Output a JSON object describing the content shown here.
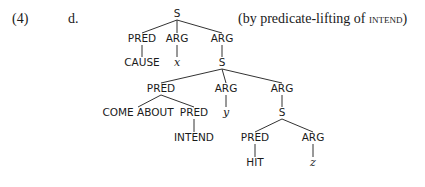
{
  "example_number": "(4)",
  "sub_label": "d.",
  "caption": {
    "prefix": "(by predicate-lifting of ",
    "smallcaps": "intend",
    "suffix": ")"
  },
  "tree": {
    "nodes": [
      {
        "id": "n0",
        "label": "S",
        "x": 177,
        "y": 17,
        "style": "label"
      },
      {
        "id": "n1",
        "label": "PRED",
        "x": 142,
        "y": 42,
        "style": "label"
      },
      {
        "id": "n2",
        "label": "ARG",
        "x": 177,
        "y": 42,
        "style": "label"
      },
      {
        "id": "n3",
        "label": "ARG",
        "x": 222,
        "y": 42,
        "style": "label"
      },
      {
        "id": "n4",
        "label": "CAUSE",
        "x": 142,
        "y": 66,
        "style": "label"
      },
      {
        "id": "n5",
        "label": "x",
        "x": 177,
        "y": 66,
        "style": "var"
      },
      {
        "id": "n6",
        "label": "S",
        "x": 222,
        "y": 66,
        "style": "label"
      },
      {
        "id": "n7",
        "label": "PRED",
        "x": 161,
        "y": 92,
        "style": "label"
      },
      {
        "id": "n8",
        "label": "ARG",
        "x": 226,
        "y": 92,
        "style": "label"
      },
      {
        "id": "n9",
        "label": "ARG",
        "x": 282,
        "y": 92,
        "style": "label"
      },
      {
        "id": "n10",
        "label": "COME ABOUT",
        "x": 138,
        "y": 116,
        "style": "label"
      },
      {
        "id": "n11",
        "label": "PRED",
        "x": 194,
        "y": 116,
        "style": "label"
      },
      {
        "id": "n12",
        "label": "y",
        "x": 226,
        "y": 116,
        "style": "var"
      },
      {
        "id": "n13",
        "label": "S",
        "x": 282,
        "y": 116,
        "style": "label"
      },
      {
        "id": "n14",
        "label": "INTEND",
        "x": 194,
        "y": 141,
        "style": "label"
      },
      {
        "id": "n15",
        "label": "PRED",
        "x": 255,
        "y": 141,
        "style": "label"
      },
      {
        "id": "n16",
        "label": "ARG",
        "x": 313,
        "y": 141,
        "style": "label"
      },
      {
        "id": "n17",
        "label": "HIT",
        "x": 255,
        "y": 166,
        "style": "label"
      },
      {
        "id": "n18",
        "label": "z",
        "x": 313,
        "y": 166,
        "style": "var"
      }
    ],
    "edges": [
      [
        "n0",
        "n1"
      ],
      [
        "n0",
        "n2"
      ],
      [
        "n0",
        "n3"
      ],
      [
        "n1",
        "n4"
      ],
      [
        "n2",
        "n5"
      ],
      [
        "n3",
        "n6"
      ],
      [
        "n6",
        "n7"
      ],
      [
        "n6",
        "n8"
      ],
      [
        "n6",
        "n9"
      ],
      [
        "n7",
        "n10"
      ],
      [
        "n7",
        "n11"
      ],
      [
        "n8",
        "n12"
      ],
      [
        "n9",
        "n13"
      ],
      [
        "n11",
        "n14"
      ],
      [
        "n13",
        "n15"
      ],
      [
        "n13",
        "n16"
      ],
      [
        "n15",
        "n17"
      ],
      [
        "n16",
        "n18"
      ]
    ]
  }
}
